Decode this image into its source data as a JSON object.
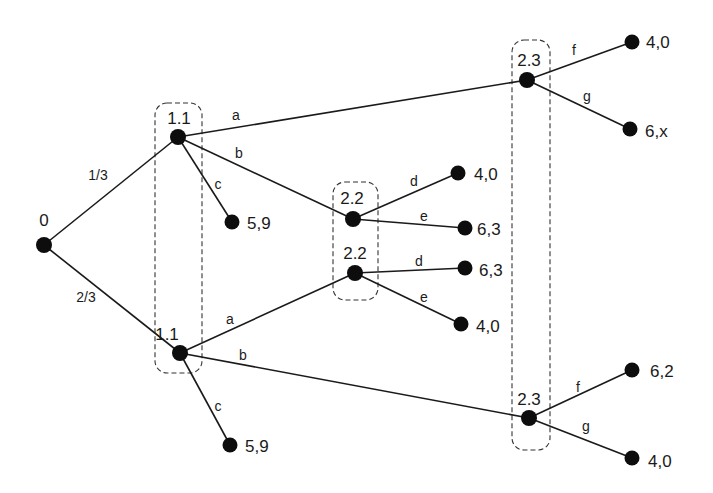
{
  "diagram": {
    "type": "extensive-form game tree",
    "root": {
      "id": "n0",
      "label": "0",
      "x": 44,
      "y": 245,
      "lx": 44,
      "ly": 226
    },
    "nodes": [
      {
        "id": "n11a",
        "label": "1.1",
        "x": 178,
        "y": 137,
        "lx": 179,
        "ly": 124
      },
      {
        "id": "n11b",
        "label": "1.1",
        "x": 180,
        "y": 353,
        "lx": 167,
        "ly": 340
      },
      {
        "id": "n22a",
        "label": "2.2",
        "x": 353,
        "y": 219,
        "lx": 352,
        "ly": 204
      },
      {
        "id": "n22b",
        "label": "2.2",
        "x": 355,
        "y": 273,
        "lx": 355,
        "ly": 259
      },
      {
        "id": "n23a",
        "label": "2.3",
        "x": 527,
        "y": 80,
        "lx": 529,
        "ly": 66
      },
      {
        "id": "n23b",
        "label": "2.3",
        "x": 529,
        "y": 418,
        "lx": 529,
        "ly": 405
      }
    ],
    "leaves": [
      {
        "id": "l1",
        "payoff": "5,9",
        "x": 232,
        "y": 222,
        "lx": 247,
        "ly": 229
      },
      {
        "id": "l2",
        "payoff": "5,9",
        "x": 230,
        "y": 445,
        "lx": 245,
        "ly": 452
      },
      {
        "id": "l3",
        "payoff": "4,0",
        "x": 458,
        "y": 173,
        "lx": 474,
        "ly": 180
      },
      {
        "id": "l4",
        "payoff": "6,3",
        "x": 465,
        "y": 228,
        "lx": 477,
        "ly": 235
      },
      {
        "id": "l5",
        "payoff": "6,3",
        "x": 465,
        "y": 268,
        "lx": 479,
        "ly": 276
      },
      {
        "id": "l6",
        "payoff": "4,0",
        "x": 461,
        "y": 324,
        "lx": 476,
        "ly": 332
      },
      {
        "id": "l7",
        "payoff": "4,0",
        "x": 632,
        "y": 42,
        "lx": 646,
        "ly": 48
      },
      {
        "id": "l8",
        "payoff": "6,x",
        "x": 630,
        "y": 129,
        "lx": 645,
        "ly": 137
      },
      {
        "id": "l9",
        "payoff": "6,2",
        "x": 632,
        "y": 370,
        "lx": 650,
        "ly": 377
      },
      {
        "id": "l10",
        "payoff": "4,0",
        "x": 632,
        "y": 458,
        "lx": 648,
        "ly": 467
      }
    ],
    "edges": [
      {
        "from": "n0",
        "to": "n11a",
        "label": "1/3",
        "lx": 98,
        "ly": 180
      },
      {
        "from": "n0",
        "to": "n11b",
        "label": "2/3",
        "lx": 86,
        "ly": 302
      },
      {
        "from": "n11a",
        "to": "n23a",
        "label": "a",
        "lx": 236,
        "ly": 120
      },
      {
        "from": "n11a",
        "to": "n22a",
        "label": "b",
        "lx": 239,
        "ly": 158
      },
      {
        "from": "n11a",
        "to": "l1",
        "label": "c",
        "lx": 218,
        "ly": 189
      },
      {
        "from": "n11b",
        "to": "n22b",
        "label": "a",
        "lx": 230,
        "ly": 324
      },
      {
        "from": "n11b",
        "to": "n23b",
        "label": "b",
        "lx": 243,
        "ly": 360
      },
      {
        "from": "n11b",
        "to": "l2",
        "label": "c",
        "lx": 218,
        "ly": 411
      },
      {
        "from": "n22a",
        "to": "l3",
        "label": "d",
        "lx": 414,
        "ly": 186
      },
      {
        "from": "n22a",
        "to": "l4",
        "label": "e",
        "lx": 424,
        "ly": 221
      },
      {
        "from": "n22b",
        "to": "l5",
        "label": "d",
        "lx": 419,
        "ly": 266
      },
      {
        "from": "n22b",
        "to": "l6",
        "label": "e",
        "lx": 424,
        "ly": 302
      },
      {
        "from": "n23a",
        "to": "l7",
        "label": "f",
        "lx": 574,
        "ly": 55
      },
      {
        "from": "n23a",
        "to": "l8",
        "label": "g",
        "lx": 587,
        "ly": 101
      },
      {
        "from": "n23b",
        "to": "l9",
        "label": "f",
        "lx": 578,
        "ly": 392
      },
      {
        "from": "n23b",
        "to": "l10",
        "label": "g",
        "lx": 586,
        "ly": 431
      }
    ],
    "information_sets": [
      {
        "name": "infoset-player1",
        "x": 155,
        "y": 103,
        "w": 47,
        "h": 270
      },
      {
        "name": "infoset-2-2",
        "x": 333,
        "y": 182,
        "w": 45,
        "h": 118
      },
      {
        "name": "infoset-2-3",
        "x": 512,
        "y": 40,
        "w": 38,
        "h": 410
      }
    ]
  }
}
